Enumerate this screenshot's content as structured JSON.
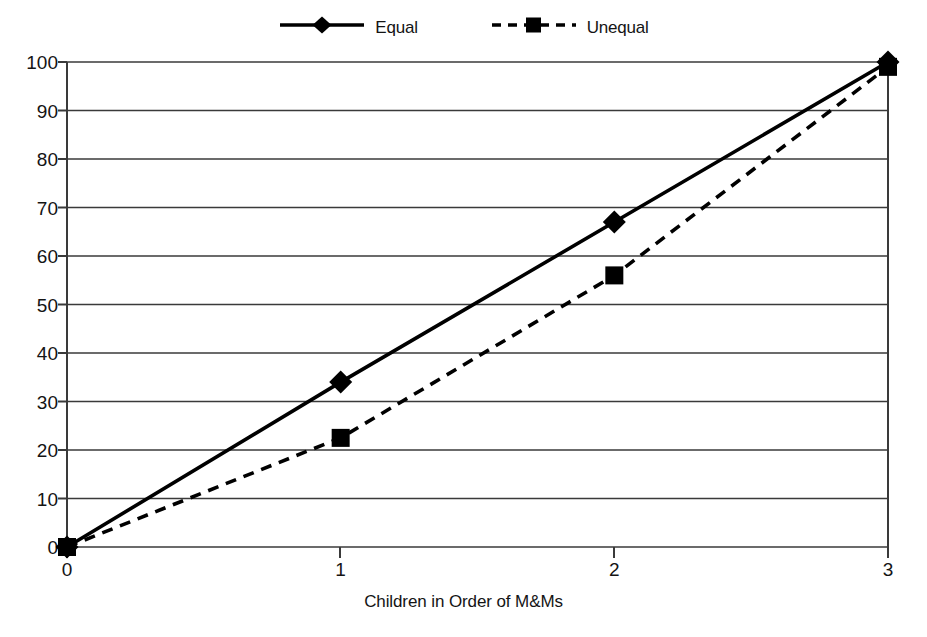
{
  "chart_data": {
    "type": "line",
    "title": "",
    "xlabel": "Children in Order of M&Ms",
    "ylabel": "",
    "x": [
      0,
      1,
      2,
      3
    ],
    "xtick_labels": [
      "0",
      "1",
      "2",
      "3"
    ],
    "ytick_labels": [
      "0",
      "10",
      "20",
      "30",
      "40",
      "50",
      "60",
      "70",
      "80",
      "90",
      "100"
    ],
    "ytick_values": [
      0,
      10,
      20,
      30,
      40,
      50,
      60,
      70,
      80,
      90,
      100
    ],
    "xlim": [
      0,
      3
    ],
    "ylim": [
      0,
      100
    ],
    "grid": "horizontal",
    "legend_position": "top-center",
    "series": [
      {
        "name": "Equal",
        "values": [
          0,
          34,
          67,
          100
        ],
        "line_style": "solid",
        "marker": "diamond",
        "color": "#000000"
      },
      {
        "name": "Unequal",
        "values": [
          0,
          22.5,
          56,
          99
        ],
        "line_style": "dashed",
        "marker": "square",
        "color": "#000000"
      }
    ]
  },
  "legend": {
    "entries": [
      {
        "label": "Equal",
        "marker_icon": "diamond-marker-icon",
        "line_icon": "solid-line-icon"
      },
      {
        "label": "Unequal",
        "marker_icon": "square-marker-icon",
        "line_icon": "dashed-line-icon"
      }
    ]
  },
  "colors": {
    "ink": "#000000",
    "gridline": "#3a3a3a",
    "axis": "#3a3a3a",
    "background": "#ffffff"
  }
}
